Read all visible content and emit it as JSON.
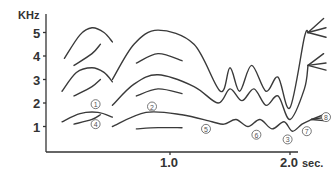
{
  "chart_data": {
    "type": "line",
    "title": "",
    "xlabel": "sec.",
    "ylabel": "KHz",
    "xlim": [
      0,
      2.3
    ],
    "ylim": [
      0,
      5.8
    ],
    "x_ticks": [
      {
        "value": 1.0,
        "label": "1.0"
      },
      {
        "value": 2.0,
        "label": "2.0"
      }
    ],
    "y_ticks": [
      {
        "value": 1,
        "label": "1"
      },
      {
        "value": 2,
        "label": "2"
      },
      {
        "value": 3,
        "label": "3"
      },
      {
        "value": 4,
        "label": "4"
      },
      {
        "value": 5,
        "label": "5"
      }
    ],
    "grid": false,
    "series": [
      {
        "name": "segment1-F1",
        "points": [
          [
            0.1,
            1.2
          ],
          [
            0.25,
            1.55
          ],
          [
            0.4,
            1.6
          ],
          [
            0.52,
            1.4
          ]
        ]
      },
      {
        "name": "segment1-F2",
        "points": [
          [
            0.1,
            2.5
          ],
          [
            0.22,
            3.3
          ],
          [
            0.35,
            3.5
          ],
          [
            0.45,
            3.3
          ],
          [
            0.52,
            2.9
          ]
        ]
      },
      {
        "name": "segment1-F3",
        "points": [
          [
            0.12,
            3.9
          ],
          [
            0.25,
            4.9
          ],
          [
            0.35,
            5.2
          ],
          [
            0.45,
            5.0
          ],
          [
            0.52,
            4.6
          ]
        ]
      },
      {
        "name": "segment1-sub4",
        "points": [
          [
            0.2,
            1.1
          ],
          [
            0.35,
            1.3
          ],
          [
            0.42,
            1.5
          ]
        ]
      },
      {
        "name": "segment1-sub3",
        "points": [
          [
            0.2,
            2.3
          ],
          [
            0.35,
            2.7
          ],
          [
            0.42,
            3.0
          ]
        ]
      },
      {
        "name": "segment1-sub5",
        "points": [
          [
            0.2,
            3.6
          ],
          [
            0.35,
            4.1
          ],
          [
            0.42,
            4.5
          ]
        ]
      },
      {
        "name": "segment2-F1",
        "points": [
          [
            0.52,
            1.0
          ],
          [
            0.8,
            1.6
          ],
          [
            1.1,
            1.5
          ],
          [
            1.35,
            1.2
          ],
          [
            1.45,
            1.1
          ],
          [
            1.55,
            1.3
          ],
          [
            1.65,
            1.0
          ],
          [
            1.75,
            1.3
          ],
          [
            1.85,
            0.9
          ],
          [
            1.95,
            1.2
          ],
          [
            2.02,
            0.8
          ],
          [
            2.1,
            1.1
          ],
          [
            2.18,
            1.3
          ]
        ]
      },
      {
        "name": "segment2-F2",
        "points": [
          [
            0.52,
            1.9
          ],
          [
            0.7,
            2.8
          ],
          [
            0.9,
            3.2
          ],
          [
            1.2,
            2.7
          ],
          [
            1.4,
            2.0
          ],
          [
            1.5,
            2.6
          ],
          [
            1.6,
            2.1
          ],
          [
            1.7,
            2.6
          ],
          [
            1.8,
            1.9
          ],
          [
            1.9,
            2.3
          ],
          [
            2.0,
            1.3
          ],
          [
            2.12,
            2.6
          ],
          [
            2.15,
            3.6
          ]
        ]
      },
      {
        "name": "segment2-F3",
        "points": [
          [
            0.52,
            3.0
          ],
          [
            0.7,
            4.5
          ],
          [
            0.9,
            5.1
          ],
          [
            1.2,
            4.5
          ],
          [
            1.42,
            2.5
          ],
          [
            1.5,
            3.5
          ],
          [
            1.58,
            2.5
          ],
          [
            1.68,
            3.6
          ],
          [
            1.8,
            2.5
          ],
          [
            1.9,
            3.1
          ],
          [
            2.0,
            1.8
          ],
          [
            2.12,
            4.8
          ],
          [
            2.15,
            5.0
          ]
        ]
      },
      {
        "name": "segment2-sub5",
        "points": [
          [
            0.72,
            0.9
          ],
          [
            0.9,
            0.95
          ],
          [
            1.1,
            0.95
          ]
        ]
      },
      {
        "name": "segment2-sub2",
        "points": [
          [
            0.72,
            2.3
          ],
          [
            0.9,
            2.6
          ],
          [
            1.1,
            2.4
          ]
        ]
      },
      {
        "name": "segment2-sub4",
        "points": [
          [
            0.72,
            3.7
          ],
          [
            0.9,
            4.1
          ],
          [
            1.1,
            3.8
          ]
        ]
      }
    ],
    "annotations": [
      {
        "label": "①",
        "x": 0.38,
        "y": 1.95
      },
      {
        "label": "④",
        "x": 0.38,
        "y": 1.1
      },
      {
        "label": "②",
        "x": 0.85,
        "y": 1.85
      },
      {
        "label": "⑤",
        "x": 1.3,
        "y": 0.9
      },
      {
        "label": "⑥",
        "x": 1.72,
        "y": 0.65
      },
      {
        "label": "③",
        "x": 1.98,
        "y": 0.45
      },
      {
        "label": "⑦",
        "x": 2.14,
        "y": 0.8
      },
      {
        "label": "⑧",
        "x": 2.3,
        "y": 1.4
      }
    ]
  }
}
